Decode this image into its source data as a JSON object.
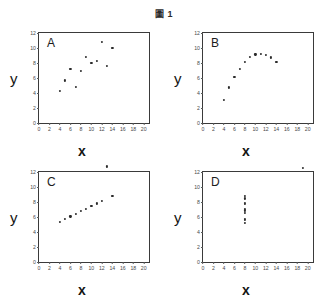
{
  "figure": {
    "title": "圖 1",
    "axis_label_x": "x",
    "axis_label_y": "y"
  },
  "chart_data": [
    {
      "type": "scatter",
      "title": "A",
      "xlabel": "x",
      "ylabel": "y",
      "xlim": [
        0,
        21
      ],
      "ylim": [
        0,
        12
      ],
      "xticks": [
        0,
        2,
        4,
        6,
        8,
        10,
        12,
        14,
        16,
        18,
        20
      ],
      "yticks": [
        0,
        2,
        4,
        6,
        8,
        10,
        12
      ],
      "grid": false,
      "legend": "none",
      "points": [
        {
          "x": 10.0,
          "y": 8.04
        },
        {
          "x": 8.0,
          "y": 6.95
        },
        {
          "x": 13.0,
          "y": 7.58
        },
        {
          "x": 9.0,
          "y": 8.81
        },
        {
          "x": 11.0,
          "y": 8.33
        },
        {
          "x": 14.0,
          "y": 9.96
        },
        {
          "x": 6.0,
          "y": 7.24
        },
        {
          "x": 4.0,
          "y": 4.26
        },
        {
          "x": 12.0,
          "y": 10.84
        },
        {
          "x": 7.0,
          "y": 4.82
        },
        {
          "x": 5.0,
          "y": 5.68
        }
      ]
    },
    {
      "type": "scatter",
      "title": "B",
      "xlabel": "x",
      "ylabel": "y",
      "xlim": [
        0,
        21
      ],
      "ylim": [
        0,
        12
      ],
      "xticks": [
        0,
        2,
        4,
        6,
        8,
        10,
        12,
        14,
        16,
        18,
        20
      ],
      "yticks": [
        0,
        2,
        4,
        6,
        8,
        10,
        12
      ],
      "grid": false,
      "legend": "none",
      "points": [
        {
          "x": 10.0,
          "y": 9.14
        },
        {
          "x": 8.0,
          "y": 8.14
        },
        {
          "x": 13.0,
          "y": 8.74
        },
        {
          "x": 9.0,
          "y": 8.77
        },
        {
          "x": 11.0,
          "y": 9.26
        },
        {
          "x": 14.0,
          "y": 8.1
        },
        {
          "x": 6.0,
          "y": 6.13
        },
        {
          "x": 4.0,
          "y": 3.1
        },
        {
          "x": 12.0,
          "y": 9.13
        },
        {
          "x": 7.0,
          "y": 7.26
        },
        {
          "x": 5.0,
          "y": 4.74
        }
      ]
    },
    {
      "type": "scatter",
      "title": "C",
      "xlabel": "x",
      "ylabel": "y",
      "xlim": [
        0,
        21
      ],
      "ylim": [
        0,
        12
      ],
      "xticks": [
        0,
        2,
        4,
        6,
        8,
        10,
        12,
        14,
        16,
        18,
        20
      ],
      "yticks": [
        0,
        2,
        4,
        6,
        8,
        10,
        12
      ],
      "grid": false,
      "legend": "none",
      "points": [
        {
          "x": 10.0,
          "y": 7.46
        },
        {
          "x": 8.0,
          "y": 6.77
        },
        {
          "x": 13.0,
          "y": 12.74
        },
        {
          "x": 9.0,
          "y": 7.11
        },
        {
          "x": 11.0,
          "y": 7.81
        },
        {
          "x": 14.0,
          "y": 8.84
        },
        {
          "x": 6.0,
          "y": 6.08
        },
        {
          "x": 4.0,
          "y": 5.39
        },
        {
          "x": 12.0,
          "y": 8.15
        },
        {
          "x": 7.0,
          "y": 6.42
        },
        {
          "x": 5.0,
          "y": 5.73
        }
      ]
    },
    {
      "type": "scatter",
      "title": "D",
      "xlabel": "x",
      "ylabel": "y",
      "xlim": [
        0,
        21
      ],
      "ylim": [
        0,
        12
      ],
      "xticks": [
        0,
        2,
        4,
        6,
        8,
        10,
        12,
        14,
        16,
        18,
        20
      ],
      "yticks": [
        0,
        2,
        4,
        6,
        8,
        10,
        12
      ],
      "grid": false,
      "legend": "none",
      "points": [
        {
          "x": 8.0,
          "y": 6.58
        },
        {
          "x": 8.0,
          "y": 5.76
        },
        {
          "x": 8.0,
          "y": 7.71
        },
        {
          "x": 8.0,
          "y": 8.84
        },
        {
          "x": 8.0,
          "y": 8.47
        },
        {
          "x": 8.0,
          "y": 7.04
        },
        {
          "x": 8.0,
          "y": 5.25
        },
        {
          "x": 19.0,
          "y": 12.5
        },
        {
          "x": 8.0,
          "y": 5.56
        },
        {
          "x": 8.0,
          "y": 7.91
        },
        {
          "x": 8.0,
          "y": 6.89
        }
      ]
    }
  ]
}
